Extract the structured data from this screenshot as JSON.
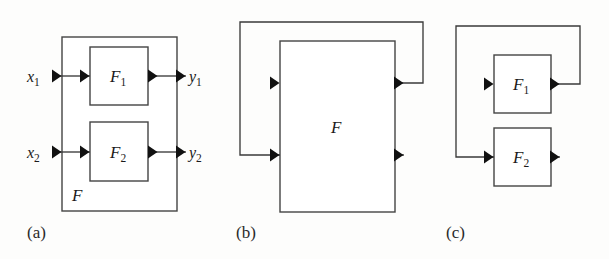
{
  "figure": {
    "type": "block-diagram",
    "background_color": "#fdfdfc",
    "line_color": "#3a3a3a",
    "arrow_color": "#111111",
    "panels": [
      {
        "id": "a",
        "caption": "(a)",
        "outer_block_label": "F",
        "blocks": [
          {
            "name": "F",
            "sub": "1"
          },
          {
            "name": "F",
            "sub": "2"
          }
        ],
        "input_labels": [
          {
            "name": "x",
            "sub": "1"
          },
          {
            "name": "x",
            "sub": "2"
          }
        ],
        "output_labels": [
          {
            "name": "y",
            "sub": "1"
          },
          {
            "name": "y",
            "sub": "2"
          }
        ]
      },
      {
        "id": "b",
        "caption": "(b)",
        "blocks": [
          {
            "name": "F",
            "sub": ""
          }
        ],
        "input_labels": [],
        "output_labels": []
      },
      {
        "id": "c",
        "caption": "(c)",
        "blocks": [
          {
            "name": "F",
            "sub": "1"
          },
          {
            "name": "F",
            "sub": "2"
          }
        ],
        "input_labels": [],
        "output_labels": []
      }
    ]
  }
}
